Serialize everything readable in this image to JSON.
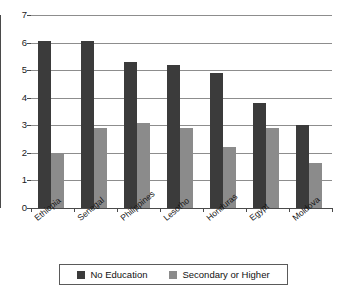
{
  "chart_data": {
    "type": "bar",
    "title": "",
    "subtitle": "",
    "xlabel": "",
    "ylabel": "",
    "categories": [
      "Ethiopia",
      "Senegal",
      "Philippines",
      "Lesotho",
      "Honduras",
      "Egypt",
      "Moldova"
    ],
    "series": [
      {
        "name": "No Education",
        "color": "#3b3b3b",
        "values": [
          6.05,
          6.05,
          5.3,
          5.2,
          4.9,
          3.8,
          3.0
        ]
      },
      {
        "name": "Secondary or Higher",
        "color": "#8b8b8b",
        "values": [
          2.0,
          2.9,
          3.1,
          2.9,
          2.2,
          2.9,
          1.65
        ]
      }
    ],
    "ylim": [
      0,
      7
    ],
    "yticks": [
      0,
      1,
      2,
      3,
      4,
      5,
      6,
      7
    ],
    "ytick_labels": [
      "0",
      "1",
      "2",
      "3",
      "4",
      "5",
      "6",
      "7"
    ],
    "grid": true,
    "grid_axis": "y",
    "legend_position": "bottom",
    "xtick_label_rotation": -40
  },
  "legend": {
    "items": [
      {
        "label": "No Education"
      },
      {
        "label": "Secondary or Higher"
      }
    ]
  }
}
